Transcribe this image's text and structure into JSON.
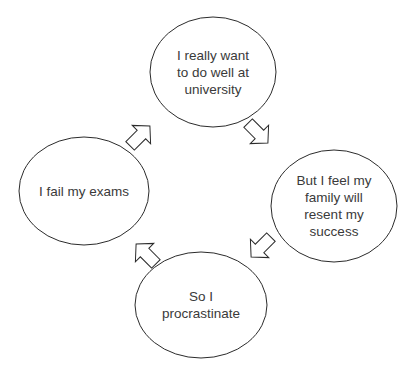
{
  "diagram": {
    "type": "cycle",
    "direction": "clockwise",
    "stroke_color": "#2b2b2b",
    "fill_color": "#ffffff",
    "text_color": "#3a3a3a",
    "nodes": [
      {
        "id": "top",
        "label": "I really want to do well at university",
        "lines": [
          "I really want",
          "to do well at",
          "university"
        ]
      },
      {
        "id": "right",
        "label": "But I feel my family will resent my success",
        "lines": [
          "But I feel my",
          "family will",
          "resent my",
          "success"
        ]
      },
      {
        "id": "bottom",
        "label": "So I procrastinate",
        "lines": [
          "So I",
          "procrastinate"
        ]
      },
      {
        "id": "left",
        "label": "I fail my exams",
        "lines": [
          "I fail my exams"
        ]
      }
    ],
    "arrows": [
      {
        "from": "top",
        "to": "right",
        "icon": "block-arrow-down-right-icon"
      },
      {
        "from": "right",
        "to": "bottom",
        "icon": "block-arrow-down-left-icon"
      },
      {
        "from": "bottom",
        "to": "left",
        "icon": "block-arrow-up-left-icon"
      },
      {
        "from": "left",
        "to": "top",
        "icon": "block-arrow-up-right-icon"
      }
    ]
  }
}
